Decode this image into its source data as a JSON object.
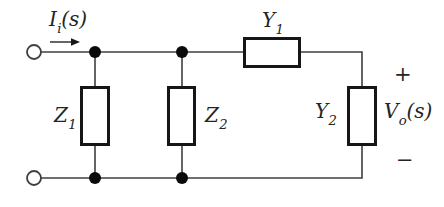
{
  "figure": {
    "colors": {
      "background": "#ffffff",
      "wire": "#3f3f3f",
      "component_border": "#161616",
      "junction_dot": "#0a0a0a",
      "text": "#242424"
    }
  },
  "labels": {
    "input_current": {
      "base": "I",
      "sub": "i",
      "suffix": "(s)"
    },
    "z1": {
      "base": "Z",
      "sub": "1"
    },
    "z2": {
      "base": "Z",
      "sub": "2"
    },
    "y1": {
      "base": "Y",
      "sub": "1"
    },
    "y2": {
      "base": "Y",
      "sub": "2"
    },
    "output_voltage": {
      "base": "V",
      "sub": "o",
      "suffix": "(s)"
    },
    "polarity_plus": "+",
    "polarity_minus": "−"
  }
}
